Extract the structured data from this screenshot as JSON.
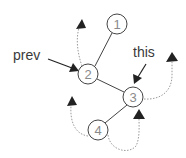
{
  "diagram": {
    "type": "tree-traversal",
    "nodes": [
      {
        "id": "1",
        "label": "1",
        "cx": 117,
        "cy": 24
      },
      {
        "id": "2",
        "label": "2",
        "cx": 88,
        "cy": 74
      },
      {
        "id": "3",
        "label": "3",
        "cx": 133,
        "cy": 97
      },
      {
        "id": "4",
        "label": "4",
        "cx": 98,
        "cy": 130
      }
    ],
    "edges": [
      {
        "from": "1",
        "to": "2"
      },
      {
        "from": "2",
        "to": "3"
      },
      {
        "from": "3",
        "to": "4"
      }
    ],
    "pointers": [
      {
        "label": "prev",
        "target": "2"
      },
      {
        "label": "this",
        "target": "3"
      }
    ],
    "dotted_arrows": [
      {
        "from": "2",
        "direction": "up-left"
      },
      {
        "from": "3",
        "direction": "up-right"
      },
      {
        "from": "4",
        "direction": "up-left"
      },
      {
        "from": "4",
        "to": "3",
        "direction": "under-to-3"
      }
    ],
    "colors": {
      "stroke": "#333333",
      "node_text": "#8a8a8a",
      "dotted": "#9a9a9a",
      "arrowhead": "#222222"
    }
  },
  "labels": {
    "prev": "prev",
    "this": "this",
    "node1": "1",
    "node2": "2",
    "node3": "3",
    "node4": "4"
  }
}
